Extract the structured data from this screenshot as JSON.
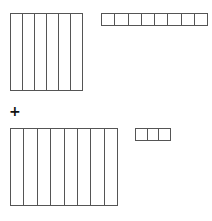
{
  "diagram": {
    "operator": "+",
    "addend_1": {
      "tens_rods": 6,
      "ones_units": 8
    },
    "addend_2": {
      "tens_rods": 8,
      "ones_units": 3
    },
    "line_color": "#555555"
  }
}
